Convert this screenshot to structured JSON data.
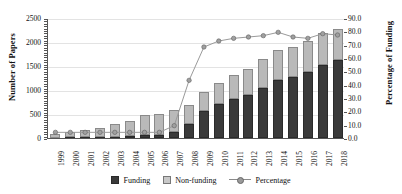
{
  "chart_data": {
    "type": "bar",
    "title": "",
    "xlabel": "",
    "ylabel": "Number of Papers",
    "y2label": "Percentage of Funding",
    "ylim": [
      0,
      2500
    ],
    "y2lim": [
      0,
      90
    ],
    "grid": true,
    "legend_position": "bottom",
    "categories": [
      "1999",
      "2000",
      "2001",
      "2002",
      "2003",
      "2004",
      "2005",
      "2006",
      "2007",
      "2008",
      "2009",
      "2010",
      "2011",
      "2012",
      "2013",
      "2014",
      "2015",
      "2016",
      "2017",
      "2018"
    ],
    "y_ticks": [
      "0",
      "500",
      "1000",
      "1500",
      "2000",
      "2500"
    ],
    "y2_ticks": [
      "0.0",
      "10.0",
      "20.0",
      "30.0",
      "40.0",
      "50.0",
      "60.0",
      "70.0",
      "80.0",
      "90.0"
    ],
    "series": [
      {
        "name": "Funding",
        "type": "bar",
        "stacked": true,
        "color": "#3a3a3a",
        "values": [
          10,
          15,
          20,
          25,
          30,
          40,
          55,
          70,
          120,
          300,
          560,
          700,
          820,
          900,
          1050,
          1200,
          1280,
          1380,
          1520,
          1620
        ]
      },
      {
        "name": "Non-funding",
        "type": "bar",
        "stacked": true,
        "color": "#b9b9b9",
        "values": [
          75,
          110,
          145,
          175,
          265,
          310,
          420,
          430,
          470,
          380,
          390,
          450,
          500,
          540,
          590,
          640,
          620,
          640,
          660,
          660
        ]
      },
      {
        "name": "Percentage",
        "type": "line",
        "axis": "secondary",
        "color": "#9a9a9a",
        "values": [
          5.0,
          5.0,
          5.0,
          5.0,
          5.0,
          5.0,
          5.0,
          5.0,
          10.0,
          44.0,
          69.0,
          73.5,
          75.5,
          76.5,
          77.5,
          80.0,
          76.5,
          75.5,
          79.0,
          78.0
        ]
      }
    ],
    "totals": [
      85,
      125,
      165,
      200,
      295,
      350,
      475,
      500,
      590,
      680,
      950,
      1150,
      1320,
      1440,
      1640,
      1840,
      1900,
      2020,
      2180,
      2280
    ]
  },
  "legend": {
    "items": [
      {
        "label": "Funding",
        "marker": "filled-square-dark"
      },
      {
        "label": "Non-funding",
        "marker": "filled-square-light"
      },
      {
        "label": "Percentage",
        "marker": "line-with-circle"
      }
    ]
  }
}
